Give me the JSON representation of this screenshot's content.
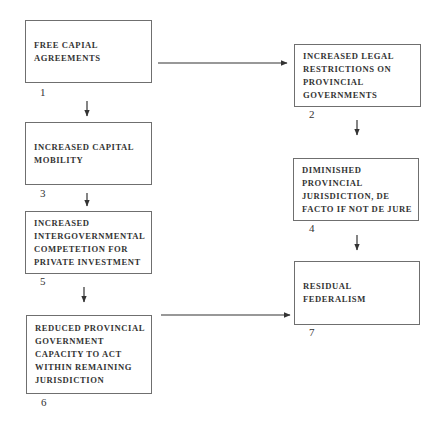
{
  "diagram": {
    "nodes": [
      {
        "id": 1,
        "label": "FREE CAPIAL\nAGREEMENTS",
        "number": "1"
      },
      {
        "id": 2,
        "label": "INCREASED LEGAL\nRESTRICTIONS ON\nPROVINCIAL\nGOVERNMENTS",
        "number": "2"
      },
      {
        "id": 3,
        "label": "INCREASED CAPITAL\nMOBILITY",
        "number": "3"
      },
      {
        "id": 4,
        "label": "DIMINISHED\nPROVINCIAL\nJURISDICTION, DE\nFACTO IF NOT DE JURE",
        "number": "4"
      },
      {
        "id": 5,
        "label": "INCREASED\nINTERGOVERNMENTAL\nCOMPETETION FOR\nPRIVATE INVESTMENT",
        "number": "5"
      },
      {
        "id": 6,
        "label": "REDUCED PROVINCIAL\nGOVERNMENT\nCAPACITY TO ACT\nWITHIN REMAINING\nJURISDICTION",
        "number": "6"
      },
      {
        "id": 7,
        "label": "RESIDUAL FEDERALISM",
        "number": "7"
      }
    ],
    "edges": [
      {
        "from": 1,
        "to": 2
      },
      {
        "from": 1,
        "to": 3
      },
      {
        "from": 3,
        "to": 5
      },
      {
        "from": 5,
        "to": 6
      },
      {
        "from": 6,
        "to": 7
      },
      {
        "from": 2,
        "to": 4
      },
      {
        "from": 4,
        "to": 7
      }
    ],
    "colors": {
      "line": "#333333",
      "border": "#6f6f6f"
    }
  }
}
